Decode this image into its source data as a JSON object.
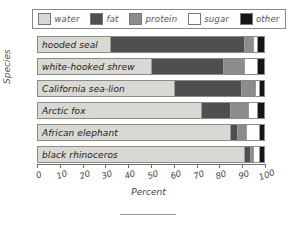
{
  "chart_data": {
    "type": "bar",
    "orientation": "horizontal",
    "stacked": true,
    "title": "",
    "xlabel": "Percent",
    "ylabel": "Species",
    "xlim": [
      0,
      100
    ],
    "xticks": [
      0,
      10,
      20,
      30,
      40,
      50,
      60,
      70,
      80,
      90,
      100
    ],
    "grid": false,
    "legend_position": "top",
    "categories": [
      "hooded seal",
      "white-hooked shrew",
      "California sea-lion",
      "Arctic fox",
      "African elephant",
      "black rhinoceros"
    ],
    "series": [
      {
        "name": "water",
        "color": "#d9d9d4",
        "values": [
          32,
          50,
          60,
          72,
          85,
          91
        ]
      },
      {
        "name": "fat",
        "color": "#4f4f4f",
        "values": [
          59,
          32,
          30,
          13,
          3,
          3
        ]
      },
      {
        "name": "protein",
        "color": "#8c8c8c",
        "values": [
          4,
          9,
          6,
          8,
          4,
          1
        ]
      },
      {
        "name": "sugar",
        "color": "#ffffff",
        "values": [
          2,
          6,
          2,
          4,
          6,
          3
        ]
      },
      {
        "name": "other",
        "color": "#151515",
        "values": [
          3,
          3,
          2,
          3,
          2,
          2
        ]
      }
    ]
  },
  "legend": {
    "items": [
      {
        "label": "water",
        "color": "#d9d9d4"
      },
      {
        "label": "fat",
        "color": "#4f4f4f"
      },
      {
        "label": "protein",
        "color": "#8c8c8c"
      },
      {
        "label": "sugar",
        "color": "#ffffff"
      },
      {
        "label": "other",
        "color": "#151515"
      }
    ]
  },
  "axes": {
    "x_title": "Percent",
    "y_title": "Species",
    "x_tick_labels": [
      "0",
      "10",
      "20",
      "30",
      "40",
      "50",
      "60",
      "70",
      "80",
      "90",
      "100"
    ]
  }
}
